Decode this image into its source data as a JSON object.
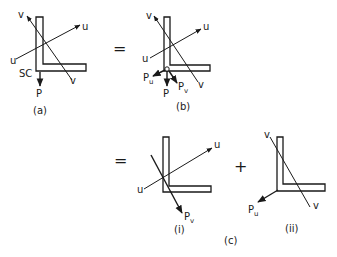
{
  "figure": {
    "panels": {
      "a": {
        "caption": "(a)",
        "axis_u_label": "u",
        "axis_v_label": "v",
        "shear_centre_label": "SC",
        "load_label": "P"
      },
      "b": {
        "caption": "(b)",
        "axis_u_label": "u",
        "axis_v_label": "v",
        "load_label": "P",
        "component_u_label": "P",
        "component_u_sub": "u",
        "component_v_label": "P",
        "component_v_sub": "v"
      },
      "c": {
        "caption": "(c)",
        "sub_i": {
          "caption": "(i)",
          "axis_u_label": "u",
          "component_v_label": "P",
          "component_v_sub": "v"
        },
        "sub_ii": {
          "caption": "(ii)",
          "axis_v_label": "v",
          "component_u_label": "P",
          "component_u_sub": "u"
        }
      }
    },
    "operators": {
      "equals_1": "=",
      "equals_2": "=",
      "plus": "+"
    }
  }
}
